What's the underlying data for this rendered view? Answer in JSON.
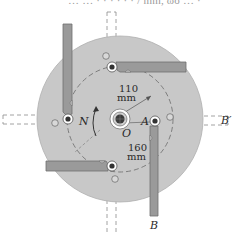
{
  "figure": {
    "cutoff_text": "… … ·   · · · · · / mm, ωo … ·",
    "labels": {
      "N": "N",
      "O": "O",
      "A": "A",
      "B": "B",
      "B_prime": "B′",
      "r1_value": "110",
      "r1_unit": "mm",
      "r2_value": "160",
      "r2_unit": "mm"
    },
    "colors": {
      "disk": "#c8c8c8",
      "disk_edge": "#b0b0b0",
      "arm": "#9a9a9a",
      "arm_edge": "#6e6e6e",
      "dashed": "#8a8a8a",
      "hub": "#3a3a3a",
      "text": "#2a2a2a"
    },
    "icons": {
      "rotation_arrow": "curved-arrow-N",
      "pivot": "pin-joint"
    }
  }
}
